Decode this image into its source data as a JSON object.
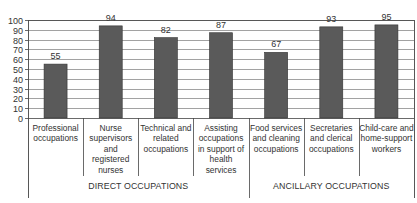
{
  "chart_data": {
    "type": "bar",
    "title": "",
    "xlabel": "",
    "ylabel": "",
    "ylim": [
      0,
      100
    ],
    "yticks": [
      0,
      10,
      20,
      30,
      40,
      50,
      60,
      70,
      80,
      90,
      100
    ],
    "grid": true,
    "legend": null,
    "categories": [
      "Professional occupations",
      "Nurse supervisors and registered nurses",
      "Technical and related occupations",
      "Assisting occupations in support of health services",
      "Food services and cleaning occupations",
      "Secretaries and clerical occupations",
      "Child-care and home-support workers"
    ],
    "category_lines": [
      [
        "Professional",
        "occupations"
      ],
      [
        "Nurse",
        "supervisors",
        "and",
        "registered",
        "nurses"
      ],
      [
        "Technical and",
        "related",
        "occupations"
      ],
      [
        "Assisting",
        "occupations",
        "in support of",
        "health",
        "services"
      ],
      [
        "Food services",
        "and cleaning",
        "occupations"
      ],
      [
        "Secretaries",
        "and clerical",
        "occupations"
      ],
      [
        "Child-care and",
        "home-support",
        "workers"
      ]
    ],
    "values": [
      55,
      94,
      82,
      87,
      67,
      93,
      95
    ],
    "data_labels": [
      "55",
      "94",
      "82",
      "87",
      "67",
      "93",
      "95"
    ],
    "groups": [
      {
        "label": "DIRECT OCCUPATIONS",
        "categories": [
          0,
          1,
          2,
          3
        ]
      },
      {
        "label": "ANCILLARY OCCUPATIONS",
        "categories": [
          4,
          5,
          6
        ]
      }
    ],
    "colors": {
      "bar": "#5a5a5a",
      "bar_edge": "#333333",
      "grid": "#8a8a8a",
      "axis": "#444444"
    }
  }
}
